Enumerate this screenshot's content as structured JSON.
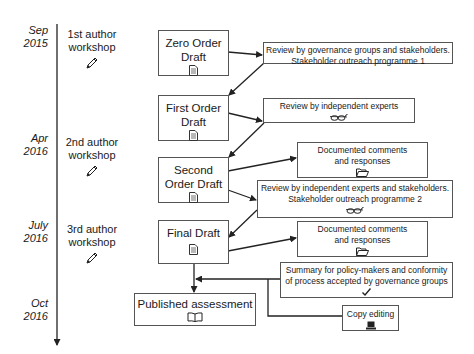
{
  "timeline": {
    "milestones": [
      {
        "date_line1": "Sep",
        "date_line2": "2015",
        "workshop_line1": "1st author",
        "workshop_line2": "workshop",
        "icon": "pencil-icon"
      },
      {
        "date_line1": "Apr",
        "date_line2": "2016",
        "workshop_line1": "2nd author",
        "workshop_line2": "workshop",
        "icon": "pencil-icon"
      },
      {
        "date_line1": "July",
        "date_line2": "2016",
        "workshop_line1": "3rd author",
        "workshop_line2": "workshop",
        "icon": "pencil-icon"
      },
      {
        "date_line1": "Oct",
        "date_line2": "2016"
      }
    ]
  },
  "drafts": [
    {
      "line1": "Zero Order",
      "line2": "Draft",
      "icon": "document-icon"
    },
    {
      "line1": "First Order",
      "line2": "Draft",
      "icon": "document-icon"
    },
    {
      "line1": "Second",
      "line2": "Order Draft",
      "icon": "document-icon"
    },
    {
      "line1": "Final Draft",
      "line2": "",
      "icon": "document-icon"
    }
  ],
  "reviews": [
    {
      "line1": "Review by governance groups and stakeholders.",
      "line2": "Stakeholder outreach programme 1",
      "icon": ""
    },
    {
      "line1": "Review by independent experts",
      "line2": "",
      "icon": "glasses-icon"
    },
    {
      "line1": "Documented comments",
      "line2": "and responses",
      "icon": "folder-icon"
    },
    {
      "line1": "Review by independent experts and stakeholders.",
      "line2": "Stakeholder outreach programme 2",
      "icon": "glasses-icon"
    },
    {
      "line1": "Documented comments",
      "line2": "and responses",
      "icon": "folder-icon"
    },
    {
      "line1": "Summary for policy-makers and conformity",
      "line2": "of process accepted by governance groups",
      "icon": "checkmark-icon"
    }
  ],
  "published": {
    "label": "Published assessment",
    "icon": "book-icon"
  },
  "copy_editing": {
    "label": "Copy editing",
    "icon": "laptop-icon"
  },
  "colors": {
    "line": "#222222",
    "box_border": "#555555"
  }
}
